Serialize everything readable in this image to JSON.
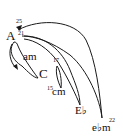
{
  "diagram": {
    "nodes": [
      {
        "id": "A",
        "label": "A"
      },
      {
        "id": "am",
        "label": "am"
      },
      {
        "id": "C",
        "label": "C"
      },
      {
        "id": "cm",
        "label": "cm"
      },
      {
        "id": "Eb",
        "label": "E♭"
      },
      {
        "id": "ebm",
        "label": "e♭m"
      }
    ],
    "numbers": {
      "n25": "25",
      "n21": "21",
      "n17": "17",
      "n15": "15",
      "n22": "22"
    },
    "edges": [
      {
        "from": "A",
        "to": "am",
        "note": "loop arrow on left"
      },
      {
        "from": "A",
        "to": "C"
      },
      {
        "from": "A",
        "to": "cm"
      },
      {
        "from": "A",
        "to": "Eb"
      },
      {
        "from": "ebm",
        "to": "A",
        "label": "25"
      }
    ],
    "colors": {
      "stroke": "#1a1a1a",
      "text": "#111111",
      "background": "#ffffff"
    }
  }
}
